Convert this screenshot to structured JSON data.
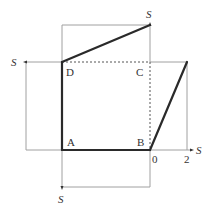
{
  "diagram": {
    "vertices": {
      "A": "A",
      "B": "B",
      "C": "C",
      "D": "D"
    },
    "axis_labels": {
      "top": "S",
      "left": "S",
      "right": "S",
      "bottom": "S"
    },
    "tick_labels": {
      "zero": "0",
      "two": "2"
    },
    "colors": {
      "thin_line": "#9a9a9a",
      "thick_line": "#2a2a2a",
      "dashed_line": "#555555",
      "text": "#333333"
    }
  }
}
